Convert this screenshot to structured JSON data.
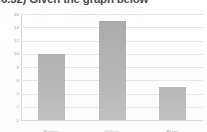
{
  "document": {
    "question_heading": "6.32) Given the graph below"
  },
  "chart_data": {
    "type": "bar",
    "title": "",
    "xlabel": "",
    "ylabel": "",
    "categories": [
      "Brown",
      "Yellow",
      "Black"
    ],
    "values": [
      10,
      15,
      5
    ],
    "ylim": [
      0,
      16
    ],
    "ytick_labels": [
      "16",
      "14",
      "12",
      "10",
      "8",
      "6",
      "4",
      "2",
      "0"
    ],
    "ytick_values": [
      16,
      14,
      12,
      10,
      8,
      6,
      4,
      2,
      0
    ],
    "grid": true,
    "legend": false,
    "bar_color": "#a6a6a6",
    "gridline_color": "#e3e3e3",
    "axis_color": "#d2d2d2",
    "tick_label_color": "#8a8a8a"
  }
}
